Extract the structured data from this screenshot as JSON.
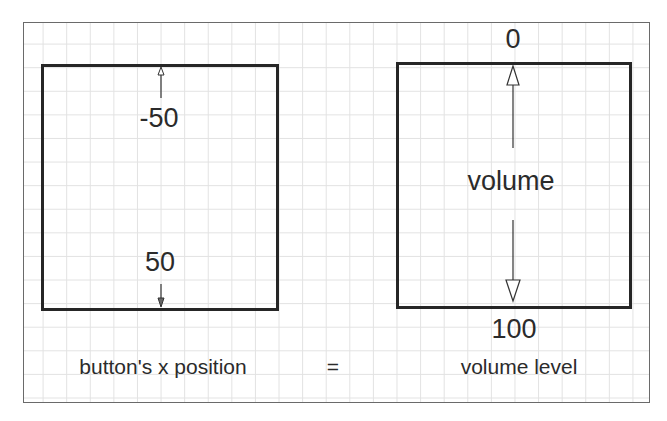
{
  "left_panel": {
    "top_value": "-50",
    "bottom_value": "50",
    "caption": "button's x position"
  },
  "operator": "=",
  "right_panel": {
    "top_value": "0",
    "center_label": "volume",
    "bottom_value": "100",
    "caption": "volume level"
  },
  "colors": {
    "box_border": "#262626",
    "grid": "#e2e2e2",
    "frame": "#6a6a6a",
    "text": "#2b2b2b"
  }
}
